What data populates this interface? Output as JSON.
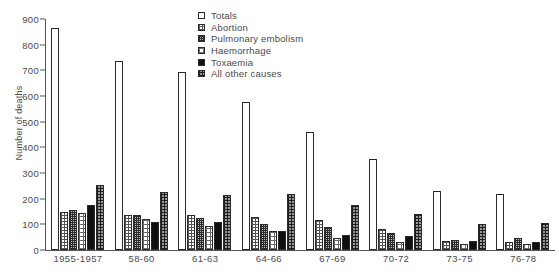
{
  "chart_data": {
    "type": "bar",
    "title": "",
    "xlabel": "",
    "ylabel": "Number of deaths",
    "ylim": [
      0,
      900
    ],
    "yticks": [
      0,
      100,
      200,
      300,
      400,
      500,
      600,
      700,
      800,
      900
    ],
    "grid": false,
    "legend_position": "top-center",
    "categories": [
      "1955-1957",
      "58-60",
      "61-63",
      "64-66",
      "67-69",
      "70-72",
      "73-75",
      "76-78"
    ],
    "series": [
      {
        "name": "Totals",
        "pattern": "open-white",
        "values": [
          865,
          737,
          695,
          578,
          460,
          355,
          228,
          220
        ]
      },
      {
        "name": "Abortion",
        "pattern": "fine-grid",
        "values": [
          150,
          135,
          135,
          130,
          115,
          80,
          35,
          30
        ]
      },
      {
        "name": "Pulmonary embolism",
        "pattern": "dense-checker",
        "values": [
          155,
          135,
          125,
          100,
          90,
          65,
          40,
          45
        ]
      },
      {
        "name": "Haemorrhage",
        "pattern": "sparse-dot-grid",
        "values": [
          145,
          120,
          95,
          73,
          45,
          30,
          25,
          22
        ]
      },
      {
        "name": "Toxaemia",
        "pattern": "solid-black",
        "values": [
          175,
          110,
          110,
          75,
          60,
          55,
          35,
          30
        ]
      },
      {
        "name": "All other causes",
        "pattern": "coarse-checker",
        "values": [
          255,
          225,
          215,
          218,
          175,
          140,
          100,
          105
        ]
      }
    ],
    "colors": {
      "axis": "#555555",
      "text": "#4a4a4a",
      "bar_outline": "#2b2b2b",
      "toxaemia_fill": "#101010",
      "background": "#ffffff"
    }
  }
}
